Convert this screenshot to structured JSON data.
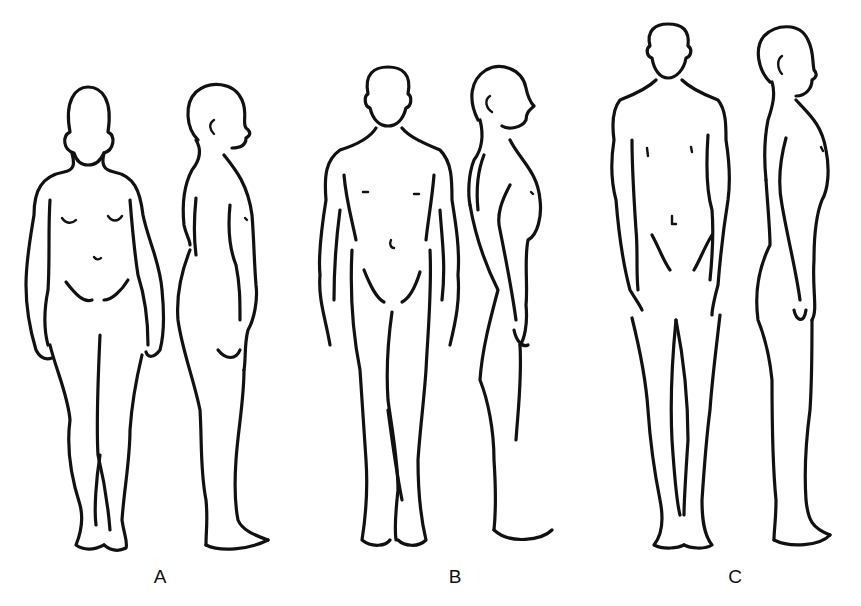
{
  "figure": {
    "panels": [
      {
        "id": "A",
        "label": "A",
        "views": [
          "front",
          "side"
        ],
        "build": "heavy, rounded (endomorphic)"
      },
      {
        "id": "B",
        "label": "B",
        "views": [
          "front",
          "side"
        ],
        "build": "muscular (mesomorphic)"
      },
      {
        "id": "C",
        "label": "C",
        "views": [
          "front",
          "side"
        ],
        "build": "tall, slender (ectomorphic)"
      }
    ]
  },
  "style": {
    "line_color": "#111111",
    "background": "#ffffff"
  }
}
